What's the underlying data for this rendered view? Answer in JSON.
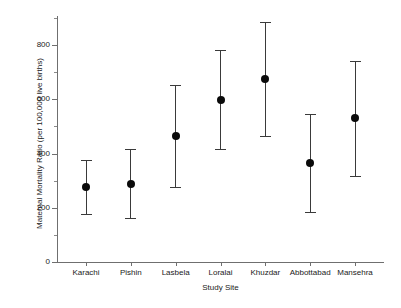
{
  "chart_data": {
    "type": "scatter",
    "title": "",
    "xlabel": "Study Site",
    "ylabel": "Maternal Mortality Ratio (per 100,000 live births)",
    "categories": [
      "Karachi",
      "Pishin",
      "Lasbela",
      "Loralai",
      "Khuzdar",
      "Abbottabad",
      "Mansehra"
    ],
    "values": [
      277,
      288,
      464,
      597,
      675,
      365,
      530
    ],
    "error_low": [
      178,
      163,
      275,
      415,
      466,
      183,
      317
    ],
    "error_high": [
      376,
      418,
      652,
      782,
      885,
      547,
      740
    ],
    "ylim": [
      0,
      900
    ],
    "yticks": [
      0,
      200,
      400,
      600,
      800
    ],
    "ytick_labels": [
      "0",
      "200",
      "400",
      "600",
      "800"
    ],
    "yminor_ticks": [
      100,
      300,
      500,
      700,
      900
    ],
    "grid": false,
    "legend": null,
    "points": [
      {
        "site": "Karachi",
        "value": 277,
        "low": 178,
        "high": 376
      },
      {
        "site": "Pishin",
        "value": 288,
        "low": 163,
        "high": 418
      },
      {
        "site": "Lasbela",
        "value": 464,
        "low": 275,
        "high": 652
      },
      {
        "site": "Loralai",
        "value": 597,
        "low": 415,
        "high": 782
      },
      {
        "site": "Khuzdar",
        "value": 675,
        "low": 466,
        "high": 885
      },
      {
        "site": "Abbottabad",
        "value": 365,
        "low": 183,
        "high": 547
      },
      {
        "site": "Mansehra",
        "value": 530,
        "low": 317,
        "high": 740
      }
    ],
    "colors": {
      "marker": "#0a0a0a",
      "whisker": "#3a3a3a",
      "axis": "#6f6f6f",
      "background": "#ffffff",
      "text": "#1a1a1a"
    }
  }
}
